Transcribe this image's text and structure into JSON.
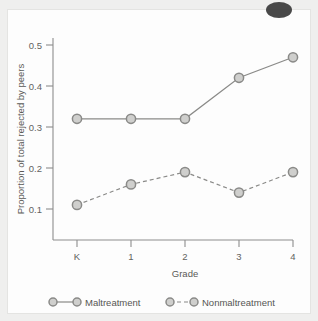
{
  "chart_data": {
    "type": "line",
    "title": "",
    "xlabel": "Grade",
    "ylabel": "Proportion of total rejected by peers",
    "categories": [
      "K",
      "1",
      "2",
      "3",
      "4"
    ],
    "x_tick_labels": [
      "K",
      "1",
      "2",
      "3",
      "4"
    ],
    "y_tick_labels": [
      "0.1",
      "0.2",
      "0.3",
      "0.4",
      "0.5"
    ],
    "y_tick_values": [
      0.1,
      0.2,
      0.3,
      0.4,
      0.5
    ],
    "ylim": [
      0.04,
      0.55
    ],
    "grid": false,
    "legend_position": "bottom",
    "series": [
      {
        "name": "Maltreatment",
        "line_style": "solid",
        "marker": "circle",
        "color": "#8a8a88",
        "values": [
          0.32,
          0.32,
          0.32,
          0.42,
          0.47
        ]
      },
      {
        "name": "Nonmaltreatment",
        "line_style": "dashed",
        "marker": "circle",
        "color": "#8a8a88",
        "values": [
          0.11,
          0.16,
          0.19,
          0.14,
          0.19
        ]
      }
    ]
  },
  "axes": {
    "y_label": "Proportion of total rejected by peers",
    "x_label": "Grade",
    "y_ticks": [
      {
        "label": "0.5"
      },
      {
        "label": "0.4"
      },
      {
        "label": "0.3"
      },
      {
        "label": "0.2"
      },
      {
        "label": "0.1"
      }
    ],
    "x_ticks": [
      {
        "label": "K"
      },
      {
        "label": "1"
      },
      {
        "label": "2"
      },
      {
        "label": "3"
      },
      {
        "label": "4"
      }
    ]
  },
  "legend": {
    "items": [
      {
        "label": "Maltreatment",
        "style": "solid"
      },
      {
        "label": "Nonmaltreatment",
        "style": "dashed"
      }
    ]
  },
  "colors": {
    "line": "#8a8a88",
    "marker_fill": "#cfcfcd",
    "axis": "#8d8d8d",
    "text": "#5a5a57",
    "paper": "#fdfdfd",
    "page": "#efefee"
  }
}
